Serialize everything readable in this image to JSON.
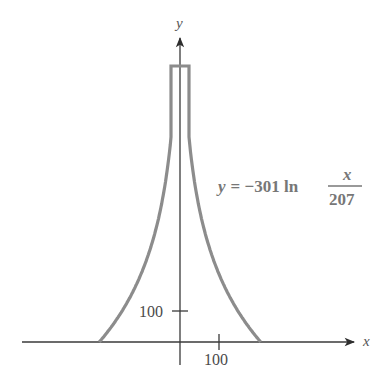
{
  "chart_data": {
    "type": "line",
    "title": "",
    "xlabel": "x",
    "ylabel": "y",
    "equation": {
      "lhs": "y",
      "equals": "=",
      "coef": "−301 ln",
      "numerator": "x",
      "denominator": "207"
    },
    "series": [
      {
        "name": "y = -301 ln(x/207)",
        "function": "y = -301*ln(|x|/207)",
        "symmetric_about_y_axis": true,
        "x_intercepts": [
          -207,
          207
        ],
        "top_flat_segment": {
          "x": [
            -23,
            23
          ],
          "y": 893
        },
        "points": [
          {
            "x": -207,
            "y": 0
          },
          {
            "x": -150,
            "y": 97
          },
          {
            "x": -100,
            "y": 219
          },
          {
            "x": -60,
            "y": 373
          },
          {
            "x": -40,
            "y": 495
          },
          {
            "x": -23,
            "y": 661
          },
          {
            "x": -23,
            "y": 893
          },
          {
            "x": 23,
            "y": 893
          },
          {
            "x": 23,
            "y": 661
          },
          {
            "x": 40,
            "y": 495
          },
          {
            "x": 60,
            "y": 373
          },
          {
            "x": 100,
            "y": 219
          },
          {
            "x": 150,
            "y": 97
          },
          {
            "x": 207,
            "y": 0
          }
        ]
      }
    ],
    "x_ticks": [
      100
    ],
    "y_ticks": [
      100
    ],
    "xlim": [
      -460,
      490
    ],
    "ylim": [
      -100,
      1050
    ],
    "grid": false,
    "legend": "none"
  },
  "labels": {
    "x_axis": "x",
    "y_axis": "y",
    "x_tick_100": "100",
    "y_tick_100": "100",
    "eq_lhs": "y",
    "eq_rest": "= −301 ln",
    "eq_num": "x",
    "eq_den": "207"
  },
  "colors": {
    "curve": "#8c8c8c",
    "axis": "#3a3a3a",
    "text": "#4a4a4a"
  }
}
